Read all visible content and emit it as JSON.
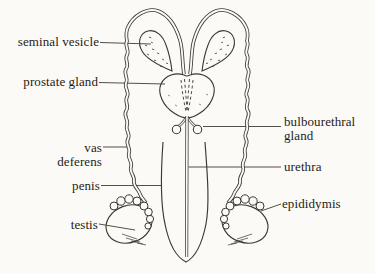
{
  "figure": {
    "colors": {
      "background": "#fbfaf6",
      "line": "#3b3833",
      "leader": "#4a463f",
      "text": "#1f1c17"
    },
    "labels": {
      "seminal_vesicle": "seminal vesicle",
      "prostate_gland": "prostate gland",
      "bulbourethral_gland": {
        "line1": "bulbourethral",
        "line2": "gland"
      },
      "vas_deferens": {
        "line1": "vas",
        "line2": "deferens"
      },
      "penis": "penis",
      "urethra": "urethra",
      "testis": "testis",
      "epididymis": "epididymis"
    }
  }
}
